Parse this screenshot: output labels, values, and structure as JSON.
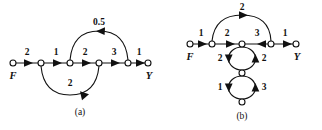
{
  "figure": {
    "background": "#ffffff",
    "ink_color": "#111111",
    "panels": [
      {
        "id": "a",
        "caption": "(a)",
        "caption_pos": {
          "x": 80,
          "y": 113
        },
        "terminals": [
          {
            "name": "input-terminal",
            "label": "F",
            "x": 13,
            "y": 63,
            "label_x": 13,
            "label_y": 76
          },
          {
            "name": "output-terminal",
            "label": "Y",
            "x": 148,
            "y": 63,
            "label_x": 148,
            "label_y": 76
          }
        ],
        "nodes": [
          {
            "name": "node-1",
            "x": 41,
            "y": 63
          },
          {
            "name": "node-2",
            "x": 70,
            "y": 63
          },
          {
            "name": "node-3",
            "x": 99,
            "y": 63
          },
          {
            "name": "node-4",
            "x": 128,
            "y": 63
          }
        ],
        "edges": [
          {
            "name": "edge-f-to-n1",
            "gain": "2",
            "label_x": 27,
            "label_y": 53,
            "kind": "straight",
            "from_x": 13,
            "from_y": 63,
            "to_x": 41,
            "to_y": 63
          },
          {
            "name": "edge-n1-to-n2",
            "gain": "1",
            "label_x": 56,
            "label_y": 53,
            "kind": "straight",
            "from_x": 41,
            "from_y": 63,
            "to_x": 70,
            "to_y": 63
          },
          {
            "name": "edge-n2-to-n3",
            "gain": "2",
            "label_x": 85,
            "label_y": 53,
            "kind": "straight",
            "from_x": 70,
            "from_y": 63,
            "to_x": 99,
            "to_y": 63
          },
          {
            "name": "edge-n3-to-n4",
            "gain": "3",
            "label_x": 114,
            "label_y": 53,
            "kind": "straight",
            "from_x": 99,
            "from_y": 63,
            "to_x": 128,
            "to_y": 63
          },
          {
            "name": "edge-n4-to-y",
            "gain": "1",
            "label_x": 139,
            "label_y": 53,
            "kind": "straight",
            "from_x": 128,
            "from_y": 63,
            "to_x": 148,
            "to_y": 63
          },
          {
            "name": "edge-feedback-top",
            "gain": "0.5",
            "label_x": 99,
            "label_y": 29,
            "kind": "arc-top",
            "from_x": 128,
            "from_y": 63,
            "to_x": 70,
            "to_y": 63
          },
          {
            "name": "edge-feedback-bottom",
            "gain": "2",
            "label_x": 70,
            "label_y": 81,
            "kind": "arc-bottom",
            "from_x": 41,
            "from_y": 63,
            "to_x": 99,
            "to_y": 63
          }
        ]
      },
      {
        "id": "b",
        "caption": "(b)",
        "caption_pos": {
          "x": 242,
          "y": 117
        },
        "terminals": [
          {
            "name": "input-terminal",
            "label": "F",
            "x": 190,
            "y": 44,
            "label_x": 190,
            "label_y": 57
          },
          {
            "name": "output-terminal",
            "label": "Y",
            "x": 296,
            "y": 44,
            "label_x": 296,
            "label_y": 57
          }
        ],
        "nodes": [
          {
            "name": "node-1",
            "x": 212,
            "y": 44
          },
          {
            "name": "node-2",
            "x": 242,
            "y": 44
          },
          {
            "name": "node-3",
            "x": 271,
            "y": 44
          },
          {
            "name": "node-mid",
            "x": 242,
            "y": 73
          },
          {
            "name": "node-bottom",
            "x": 242,
            "y": 102
          }
        ],
        "edges": [
          {
            "name": "edge-f-to-n1",
            "gain": "1",
            "label_x": 201,
            "label_y": 34,
            "kind": "straight",
            "from_x": 190,
            "from_y": 44,
            "to_x": 212,
            "to_y": 44
          },
          {
            "name": "edge-n1-to-n2",
            "gain": "2",
            "label_x": 227,
            "label_y": 34,
            "kind": "straight",
            "from_x": 212,
            "from_y": 44,
            "to_x": 242,
            "to_y": 44
          },
          {
            "name": "edge-n3-to-n2",
            "gain": "3",
            "label_x": 257,
            "label_y": 34,
            "kind": "straight-left",
            "from_x": 271,
            "from_y": 44,
            "to_x": 242,
            "to_y": 44
          },
          {
            "name": "edge-n3-to-y",
            "gain": "1",
            "label_x": 284,
            "label_y": 34,
            "kind": "straight",
            "from_x": 271,
            "from_y": 44,
            "to_x": 296,
            "to_y": 44
          },
          {
            "name": "edge-arc-top",
            "gain": "2",
            "label_x": 242,
            "label_y": 12,
            "kind": "arc-top",
            "from_x": 212,
            "from_y": 44,
            "to_x": 271,
            "to_y": 44
          },
          {
            "name": "edge-loop-upper-left",
            "gain": "2",
            "label_x": 221,
            "label_y": 59,
            "kind": "loop-left",
            "from_x": 242,
            "from_y": 44,
            "to_x": 242,
            "to_y": 73
          },
          {
            "name": "edge-loop-upper-right",
            "gain": "2",
            "label_x": 263,
            "label_y": 59,
            "kind": "loop-right",
            "from_x": 242,
            "from_y": 73,
            "to_x": 242,
            "to_y": 44
          },
          {
            "name": "edge-loop-lower-left",
            "gain": "1",
            "label_x": 221,
            "label_y": 88,
            "kind": "loop-left",
            "from_x": 242,
            "from_y": 73,
            "to_x": 242,
            "to_y": 102
          },
          {
            "name": "edge-loop-lower-right",
            "gain": "3",
            "label_x": 263,
            "label_y": 88,
            "kind": "loop-right",
            "from_x": 242,
            "from_y": 102,
            "to_x": 242,
            "to_y": 73
          }
        ]
      }
    ]
  }
}
